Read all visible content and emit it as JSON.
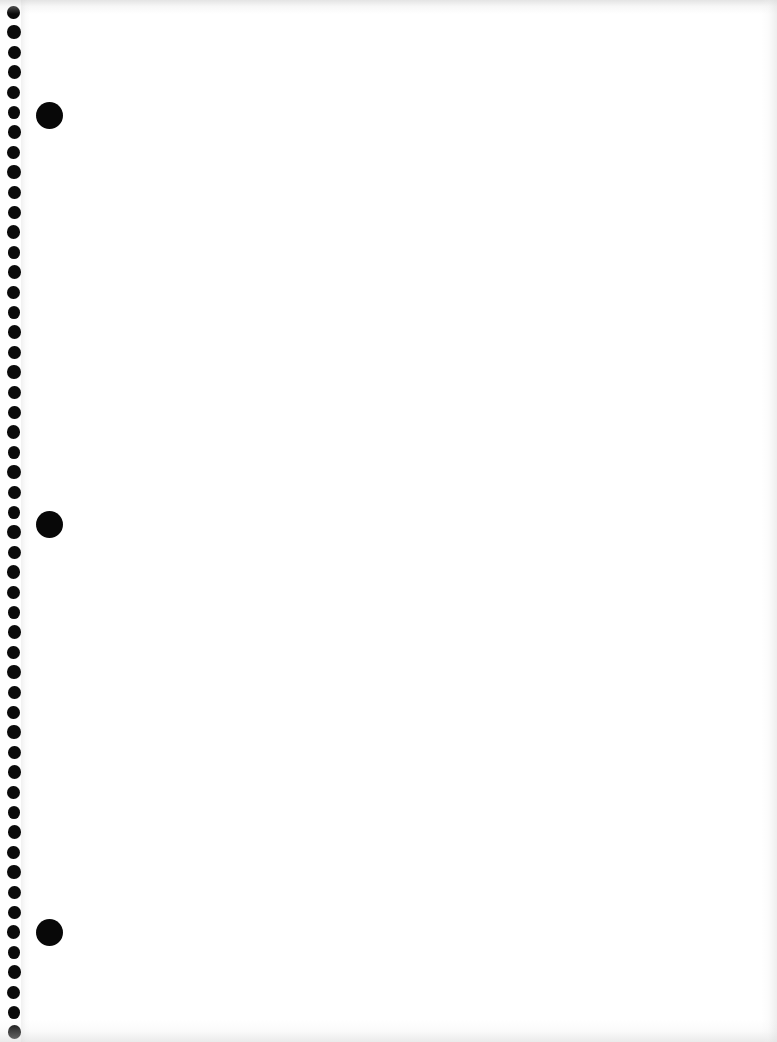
{
  "document": {
    "type": "scanned-page",
    "title": "Blank spiral notebook page",
    "page_width": 777,
    "page_height": 1042,
    "background_color": "#ffffff",
    "paper_tone": "#fdfdfd",
    "body_text": "",
    "body_note": "blank page — no handwriting, print, or ruled lines visible"
  },
  "binding": {
    "label": "spiral binding hole column",
    "hole_color": "#0b0b0b",
    "hole_center_x": 14,
    "hole_diameter": 13,
    "hole_spacing": 20,
    "first_hole_center_y": 12,
    "hole_count": 52,
    "holes_y": [
      12,
      32,
      52,
      72,
      92,
      112,
      132,
      152,
      172,
      192,
      212,
      232,
      252,
      272,
      292,
      312,
      332,
      352,
      372,
      392,
      412,
      432,
      452,
      472,
      492,
      512,
      532,
      552,
      572,
      592,
      612,
      632,
      652,
      672,
      692,
      712,
      732,
      752,
      772,
      792,
      812,
      832,
      852,
      872,
      892,
      912,
      932,
      952,
      972,
      992,
      1012,
      1032
    ]
  },
  "punch_holes": {
    "label": "three-ring binder punch holes",
    "color": "#080808",
    "center_x": 49,
    "diameter": 27,
    "items": [
      {
        "name": "punch-hole-top",
        "center_y": 115
      },
      {
        "name": "punch-hole-middle",
        "center_y": 524
      },
      {
        "name": "punch-hole-bottom",
        "center_y": 932
      }
    ]
  },
  "scan_artifacts": {
    "top_edge_shadow": "#cdcdcd",
    "bottom_edge_shadow": "#d6d6d6",
    "right_edge_shadow": "#dedede",
    "gutter_shadow": "#ececec"
  }
}
